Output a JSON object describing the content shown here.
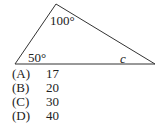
{
  "figure": {
    "shape": "triangle",
    "vertices": [
      [
        15,
        64
      ],
      [
        56,
        4
      ],
      [
        155,
        64
      ]
    ],
    "angle_labels": {
      "top": "100°",
      "bottom_left": "50°",
      "bottom_right": "c"
    }
  },
  "options": [
    {
      "letter": "(A)",
      "value": "17"
    },
    {
      "letter": "(B)",
      "value": "20"
    },
    {
      "letter": "(C)",
      "value": "30"
    },
    {
      "letter": "(D)",
      "value": "40"
    }
  ]
}
